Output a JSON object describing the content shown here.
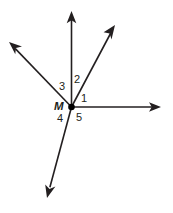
{
  "figure": {
    "type": "geometry-angle-diagram",
    "canvas": {
      "width": 173,
      "height": 213,
      "background": "#ffffff"
    },
    "stroke_color": "#231f20",
    "label_color": "#231f20",
    "vertex": {
      "name": "M",
      "label": "M",
      "x": 71.5,
      "y": 107
    },
    "rays": [
      {
        "name": "ray-right",
        "from": {
          "x": 71.5,
          "y": 107
        },
        "to": {
          "x": 161,
          "y": 107
        },
        "arrow": true
      },
      {
        "name": "ray-upper-right",
        "from": {
          "x": 71.5,
          "y": 107
        },
        "to": {
          "x": 115,
          "y": 25
        },
        "arrow": true
      },
      {
        "name": "ray-up",
        "from": {
          "x": 71.5,
          "y": 107
        },
        "to": {
          "x": 71.5,
          "y": 11
        },
        "arrow": true
      },
      {
        "name": "ray-upper-left",
        "from": {
          "x": 71.5,
          "y": 107
        },
        "to": {
          "x": 9,
          "y": 42
        },
        "arrow": true
      },
      {
        "name": "ray-lower-left",
        "from": {
          "x": 71.5,
          "y": 107
        },
        "to": {
          "x": 47,
          "y": 198
        },
        "arrow": true
      }
    ],
    "angle_labels": [
      {
        "id": "1",
        "text": "1",
        "x": 81,
        "y": 93,
        "between": [
          "ray-right",
          "ray-upper-right"
        ]
      },
      {
        "id": "2",
        "text": "2",
        "x": 74,
        "y": 74,
        "between": [
          "ray-upper-right",
          "ray-up"
        ]
      },
      {
        "id": "3",
        "text": "3",
        "x": 59,
        "y": 81,
        "between": [
          "ray-up",
          "ray-upper-left"
        ]
      },
      {
        "id": "4",
        "text": "4",
        "x": 57,
        "y": 113,
        "between": [
          "ray-upper-left",
          "ray-lower-left"
        ]
      },
      {
        "id": "5",
        "text": "5",
        "x": 76,
        "y": 112,
        "between": [
          "ray-lower-left",
          "ray-right"
        ]
      }
    ]
  }
}
